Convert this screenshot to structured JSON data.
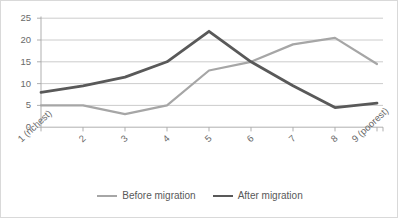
{
  "chart_data": {
    "type": "line",
    "title": "",
    "subtitle": "",
    "xlabel": "",
    "ylabel": "",
    "categories": [
      "1 (richest)",
      "2",
      "3",
      "4",
      "5",
      "6",
      "7",
      "8",
      "9 (poorest)"
    ],
    "series": [
      {
        "name": "Before migration",
        "color": "#a6a6a6",
        "values": [
          5,
          5,
          3,
          5,
          13,
          15,
          19,
          20.5,
          14.5
        ]
      },
      {
        "name": "After migration",
        "color": "#595959",
        "values": [
          8,
          9.5,
          11.5,
          15,
          22,
          15,
          9.5,
          4.5,
          5.5
        ]
      }
    ],
    "ylim": [
      0,
      25
    ],
    "ytick_labels": [
      "0",
      "5",
      "10",
      "15",
      "20",
      "25"
    ],
    "ytick_values": [
      0,
      5,
      10,
      15,
      20,
      25
    ],
    "grid": "horizontal",
    "legend_position": "bottom"
  },
  "legend": {
    "entries": [
      {
        "label": "Before migration",
        "swatch": "line-swatch-light"
      },
      {
        "label": "After migration",
        "swatch": "line-swatch-dark"
      }
    ]
  },
  "axis": {
    "y_labels": [
      "25",
      "20",
      "15",
      "10",
      "5",
      "0"
    ],
    "x_labels": [
      "1 (richest)",
      "2",
      "3",
      "4",
      "5",
      "6",
      "7",
      "8",
      "9 (poorest)"
    ]
  },
  "colors": {
    "before_migration": "#a6a6a6",
    "after_migration": "#595959",
    "gridline": "#bfbfbf",
    "axis": "#a6a6a6",
    "frame": "#d9d9d9",
    "tick_text": "#6a6a6a",
    "legend_text": "#595959",
    "background": "#ffffff"
  }
}
